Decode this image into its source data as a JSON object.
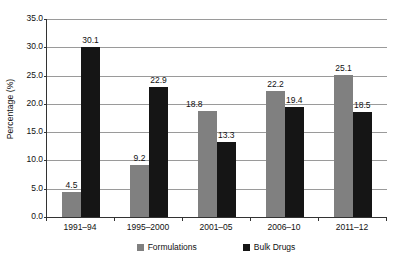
{
  "chart_data": {
    "type": "bar",
    "title": "",
    "xlabel": "",
    "ylabel": "Percentage (%)",
    "ylim": [
      0,
      35
    ],
    "ytick_labels": [
      "0.0",
      "5.0",
      "10.0",
      "15.0",
      "20.0",
      "25.0",
      "30.0",
      "35.0"
    ],
    "ytick_values": [
      0,
      5,
      10,
      15,
      20,
      25,
      30,
      35
    ],
    "grid": true,
    "legend_position": "bottom",
    "categories": [
      "1991–94",
      "1995–2000",
      "2001–05",
      "2006–10",
      "2011–12"
    ],
    "series": [
      {
        "name": "Formulations",
        "color": "#808080",
        "values": [
          4.5,
          9.2,
          18.8,
          22.2,
          25.1
        ],
        "labels": [
          "4.5",
          "9.2",
          "18.8",
          "22.2",
          "25.1"
        ]
      },
      {
        "name": "Bulk Drugs",
        "color": "#151515",
        "values": [
          30.1,
          22.9,
          13.3,
          19.4,
          18.5
        ],
        "labels": [
          "30.1",
          "22.9",
          "13.3",
          "19.4",
          "18.5"
        ]
      }
    ]
  },
  "legend": {
    "items": [
      {
        "label": "Formulations",
        "swatch": "gray-square-icon"
      },
      {
        "label": "Bulk Drugs",
        "swatch": "black-square-icon"
      }
    ]
  }
}
